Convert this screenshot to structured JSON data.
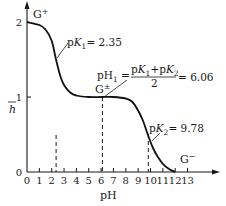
{
  "chart_data": {
    "type": "line",
    "title": "",
    "xlabel": "pH",
    "ylabel": "h̄",
    "xlim": [
      0,
      14
    ],
    "ylim": [
      0,
      2
    ],
    "grid": false,
    "x_ticks": [
      "0",
      "1",
      "2",
      "3",
      "4",
      "5",
      "6",
      "7",
      "8",
      "9",
      "10",
      "11",
      "12",
      "13"
    ],
    "y_ticks": [
      "0",
      "1",
      "2"
    ],
    "series": [
      {
        "name": "titration curve (h̄ vs pH)",
        "x": [
          0,
          1,
          1.5,
          2,
          2.35,
          2.7,
          3,
          3.5,
          4,
          5,
          6.06,
          7,
          8,
          8.5,
          9,
          9.4,
          9.78,
          10.2,
          10.6,
          11,
          11.5,
          12
        ],
        "y": [
          2.0,
          1.96,
          1.9,
          1.75,
          1.5,
          1.28,
          1.16,
          1.06,
          1.02,
          1.0,
          1.0,
          1.0,
          0.98,
          0.94,
          0.82,
          0.68,
          0.5,
          0.32,
          0.2,
          0.11,
          0.04,
          0.0
        ]
      }
    ],
    "annotations": [
      {
        "text": "G⁺",
        "x": 0.5,
        "y": 2.0
      },
      {
        "text": "pK₁ = 2.35",
        "x": 2.35,
        "y": 1.5,
        "dashed_drop_line": true
      },
      {
        "text": "pH₁ = (pK₁ + pK₂)/2 = 6.06",
        "x": 6.06,
        "y": 1.0,
        "dashed_drop_line": true
      },
      {
        "text": "G±",
        "x": 6.06,
        "y": 1.0
      },
      {
        "text": "pK₂ = 9.78",
        "x": 9.78,
        "y": 0.5,
        "dashed_drop_line": true
      },
      {
        "text": "G⁻",
        "x": 12,
        "y": 0.15
      }
    ],
    "legend": null
  },
  "labels": {
    "g_plus": "G⁺",
    "g_plus_sup": "+",
    "g_zw": "G",
    "g_zw_sup": "±",
    "g_minus": "G",
    "g_minus_sup": "−",
    "pk1_label": "pK",
    "pk1_sub": "1",
    "pk1_value": "= 2.35",
    "pk2_label": "pK",
    "pk2_sub": "2",
    "pk2_value": "= 9.78",
    "ph1_lhs": "pH",
    "ph1_sub": "1",
    "ph1_eq": "=",
    "ph1_num": "pK₁+pK₂",
    "ph1_den": "2",
    "ph1_value": "= 6.06",
    "xlabel": "pH",
    "ylabel": "h"
  }
}
